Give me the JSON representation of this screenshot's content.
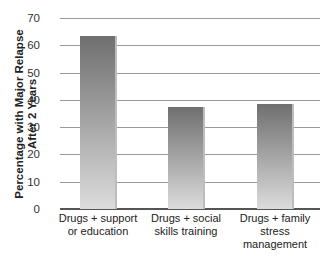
{
  "chart_data": {
    "type": "bar",
    "title": "",
    "xlabel": "",
    "ylabel": "Percentage with Major Relapse After 2 Years",
    "ylabel_lines": [
      "Percentage with Major Relapse",
      "After 2 Years"
    ],
    "categories": [
      "Drugs + support or education",
      "Drugs + social skills training",
      "Drugs + family stress management"
    ],
    "category_lines": [
      [
        "Drugs + support",
        "or education"
      ],
      [
        "Drugs + social",
        "skills training"
      ],
      [
        "Drugs + family",
        "stress",
        "management"
      ]
    ],
    "values": [
      63.5,
      37.3,
      38.5
    ],
    "ylim": [
      0,
      70
    ],
    "yticks": [
      "0",
      "10",
      "20",
      "30",
      "40",
      "50",
      "60",
      "70"
    ],
    "grid": true,
    "legend": null
  }
}
